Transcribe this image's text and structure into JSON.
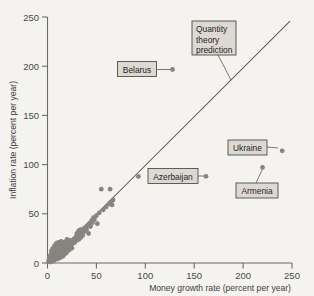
{
  "chart_data": {
    "type": "scatter",
    "title": "",
    "xlabel": "Money growth rate (percent per year)",
    "ylabel": "Inflation rate (percent per year)",
    "xlim": [
      0,
      250
    ],
    "ylim": [
      0,
      250
    ],
    "xticks": [
      0,
      50,
      100,
      150,
      200,
      250
    ],
    "yticks": [
      0,
      50,
      100,
      150,
      200,
      250
    ],
    "xtick_labels": [
      "0",
      "50",
      "100",
      "150",
      "200",
      "250"
    ],
    "ytick_labels": [
      "0",
      "50",
      "100",
      "150",
      "200",
      "250"
    ],
    "grid": false,
    "legend": "none",
    "reference_line": {
      "name": "Quantity theory prediction",
      "equation": "y = x",
      "slope": 1,
      "intercept": 0,
      "x_start": 0,
      "x_end": 250
    },
    "points": [
      {
        "x": 1,
        "y": 2
      },
      {
        "x": 2,
        "y": 3
      },
      {
        "x": 2,
        "y": 6
      },
      {
        "x": 3,
        "y": 1
      },
      {
        "x": 3,
        "y": 4
      },
      {
        "x": 3,
        "y": 8
      },
      {
        "x": 4,
        "y": 2
      },
      {
        "x": 4,
        "y": 5
      },
      {
        "x": 4,
        "y": 9
      },
      {
        "x": 4,
        "y": 12
      },
      {
        "x": 5,
        "y": 3
      },
      {
        "x": 5,
        "y": 6
      },
      {
        "x": 5,
        "y": 10
      },
      {
        "x": 5,
        "y": 14
      },
      {
        "x": 6,
        "y": 2
      },
      {
        "x": 6,
        "y": 5
      },
      {
        "x": 6,
        "y": 8
      },
      {
        "x": 6,
        "y": 11
      },
      {
        "x": 6,
        "y": 15
      },
      {
        "x": 7,
        "y": 3
      },
      {
        "x": 7,
        "y": 7
      },
      {
        "x": 7,
        "y": 9
      },
      {
        "x": 7,
        "y": 13
      },
      {
        "x": 7,
        "y": 17
      },
      {
        "x": 8,
        "y": 4
      },
      {
        "x": 8,
        "y": 6
      },
      {
        "x": 8,
        "y": 10
      },
      {
        "x": 8,
        "y": 14
      },
      {
        "x": 8,
        "y": 18
      },
      {
        "x": 9,
        "y": 5
      },
      {
        "x": 9,
        "y": 8
      },
      {
        "x": 9,
        "y": 12
      },
      {
        "x": 9,
        "y": 16
      },
      {
        "x": 9,
        "y": 20
      },
      {
        "x": 10,
        "y": 4
      },
      {
        "x": 10,
        "y": 7
      },
      {
        "x": 10,
        "y": 11
      },
      {
        "x": 10,
        "y": 15
      },
      {
        "x": 10,
        "y": 19
      },
      {
        "x": 11,
        "y": 6
      },
      {
        "x": 11,
        "y": 9
      },
      {
        "x": 11,
        "y": 13
      },
      {
        "x": 11,
        "y": 17
      },
      {
        "x": 11,
        "y": 21
      },
      {
        "x": 12,
        "y": 5
      },
      {
        "x": 12,
        "y": 8
      },
      {
        "x": 12,
        "y": 12
      },
      {
        "x": 12,
        "y": 16
      },
      {
        "x": 12,
        "y": 20
      },
      {
        "x": 13,
        "y": 7
      },
      {
        "x": 13,
        "y": 10
      },
      {
        "x": 13,
        "y": 14
      },
      {
        "x": 13,
        "y": 18
      },
      {
        "x": 14,
        "y": 6
      },
      {
        "x": 14,
        "y": 9
      },
      {
        "x": 14,
        "y": 13
      },
      {
        "x": 14,
        "y": 17
      },
      {
        "x": 14,
        "y": 22
      },
      {
        "x": 15,
        "y": 8
      },
      {
        "x": 15,
        "y": 11
      },
      {
        "x": 15,
        "y": 15
      },
      {
        "x": 15,
        "y": 19
      },
      {
        "x": 16,
        "y": 7
      },
      {
        "x": 16,
        "y": 12
      },
      {
        "x": 16,
        "y": 16
      },
      {
        "x": 16,
        "y": 21
      },
      {
        "x": 17,
        "y": 9
      },
      {
        "x": 17,
        "y": 14
      },
      {
        "x": 17,
        "y": 18
      },
      {
        "x": 18,
        "y": 11
      },
      {
        "x": 18,
        "y": 15
      },
      {
        "x": 18,
        "y": 20
      },
      {
        "x": 19,
        "y": 10
      },
      {
        "x": 19,
        "y": 16
      },
      {
        "x": 19,
        "y": 22
      },
      {
        "x": 20,
        "y": 12
      },
      {
        "x": 20,
        "y": 18
      },
      {
        "x": 20,
        "y": 24
      },
      {
        "x": 21,
        "y": 14
      },
      {
        "x": 21,
        "y": 20
      },
      {
        "x": 22,
        "y": 13
      },
      {
        "x": 22,
        "y": 19
      },
      {
        "x": 23,
        "y": 16
      },
      {
        "x": 23,
        "y": 23
      },
      {
        "x": 24,
        "y": 18
      },
      {
        "x": 25,
        "y": 15
      },
      {
        "x": 25,
        "y": 22
      },
      {
        "x": 26,
        "y": 20
      },
      {
        "x": 27,
        "y": 24
      },
      {
        "x": 28,
        "y": 21
      },
      {
        "x": 29,
        "y": 26
      },
      {
        "x": 30,
        "y": 23
      },
      {
        "x": 30,
        "y": 30
      },
      {
        "x": 31,
        "y": 27
      },
      {
        "x": 32,
        "y": 24
      },
      {
        "x": 32,
        "y": 33
      },
      {
        "x": 33,
        "y": 29
      },
      {
        "x": 34,
        "y": 26
      },
      {
        "x": 34,
        "y": 34
      },
      {
        "x": 35,
        "y": 31
      },
      {
        "x": 36,
        "y": 28
      },
      {
        "x": 37,
        "y": 35
      },
      {
        "x": 38,
        "y": 32
      },
      {
        "x": 39,
        "y": 36
      },
      {
        "x": 40,
        "y": 34
      },
      {
        "x": 41,
        "y": 38
      },
      {
        "x": 42,
        "y": 30
      },
      {
        "x": 43,
        "y": 40
      },
      {
        "x": 44,
        "y": 37
      },
      {
        "x": 45,
        "y": 43
      },
      {
        "x": 46,
        "y": 41
      },
      {
        "x": 47,
        "y": 46
      },
      {
        "x": 48,
        "y": 44
      },
      {
        "x": 50,
        "y": 48
      },
      {
        "x": 51,
        "y": 40
      },
      {
        "x": 53,
        "y": 51
      },
      {
        "x": 55,
        "y": 75
      },
      {
        "x": 57,
        "y": 54
      },
      {
        "x": 60,
        "y": 57
      },
      {
        "x": 63,
        "y": 60
      },
      {
        "x": 64,
        "y": 75
      },
      {
        "x": 65,
        "y": 62
      },
      {
        "x": 66,
        "y": 59
      },
      {
        "x": 67,
        "y": 64
      },
      {
        "x": 93,
        "y": 88
      },
      {
        "x": 127,
        "y": 194,
        "label": "Belarus"
      },
      {
        "x": 168,
        "y": 85,
        "label": "Azerbaijan"
      },
      {
        "x": 240,
        "y": 114,
        "label": "Ukraine"
      },
      {
        "x": 224,
        "y": 97,
        "label": "Armenia"
      }
    ],
    "annotations": [
      {
        "name": "quantity-theory-prediction",
        "text": "Quantity theory prediction",
        "lines": [
          "Quantity",
          "theory",
          "prediction"
        ]
      },
      {
        "name": "belarus",
        "text": "Belarus"
      },
      {
        "name": "azerbaijan",
        "text": "Azerbaijan"
      },
      {
        "name": "ukraine",
        "text": "Ukraine"
      },
      {
        "name": "armenia",
        "text": "Armenia"
      }
    ]
  },
  "colors": {
    "background": "#f5f3ef",
    "point": "#87857f",
    "axis": "#6d6b68",
    "line": "#5c5a57",
    "label_box_fill": "#ddd9d2",
    "label_box_border": "#3d3b39",
    "text": "#26241f"
  }
}
